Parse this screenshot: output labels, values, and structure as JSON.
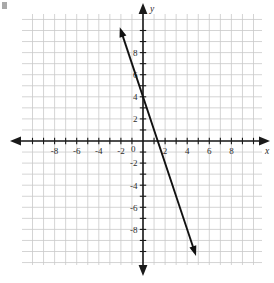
{
  "figure": {
    "kind": "coordinate-plane-line-graph",
    "background_color": "#ffffff",
    "grid_color": "#c9c9c9",
    "axis_color": "#1a1a1a",
    "line_color": "#111111",
    "label_color": "#2b2b2b"
  },
  "axes": {
    "x_name": "x",
    "y_name": "y",
    "origin_label": "0",
    "x_range": [
      -10,
      10
    ],
    "y_range": [
      -10,
      10
    ],
    "tick_step": 1,
    "label_step": 2,
    "grid": true,
    "x_tick_labels": [
      "-8",
      "-6",
      "-4",
      "-2",
      "2",
      "4",
      "6",
      "8"
    ],
    "x_tick_values": [
      -8,
      -6,
      -4,
      -2,
      2,
      4,
      6,
      8
    ],
    "y_tick_labels": [
      "8",
      "6",
      "4",
      "2",
      "-2",
      "-4",
      "-6",
      "-8"
    ],
    "y_tick_values": [
      8,
      6,
      4,
      2,
      -2,
      -4,
      -6,
      -8
    ]
  },
  "chart_data": {
    "type": "line",
    "title": "",
    "xlabel": "x",
    "ylabel": "y",
    "xlim": [
      -10,
      10
    ],
    "ylim": [
      -10,
      10
    ],
    "grid": true,
    "legend": "none",
    "series": [
      {
        "name": "line",
        "equation": "y = -3x + 4",
        "slope": -3,
        "intercept": 4,
        "x_intercept": 1.33,
        "arrows": "both",
        "x": [
          -2.1,
          4.8
        ],
        "y": [
          10.3,
          -10.4
        ],
        "points": [
          {
            "x": -2,
            "y": 10
          },
          {
            "x": -1,
            "y": 7
          },
          {
            "x": 0,
            "y": 4
          },
          {
            "x": 1,
            "y": 1
          },
          {
            "x": 2,
            "y": -2
          },
          {
            "x": 3,
            "y": -5
          },
          {
            "x": 4,
            "y": -8
          }
        ]
      }
    ]
  }
}
